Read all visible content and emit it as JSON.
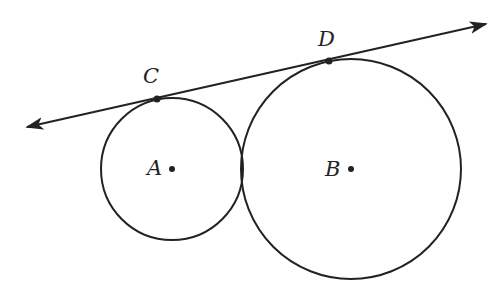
{
  "diagram": {
    "type": "geometry",
    "stroke_color": "#222222",
    "circles": [
      {
        "name": "A",
        "cx": 172,
        "cy": 169,
        "r": 71
      },
      {
        "name": "B",
        "cx": 351,
        "cy": 169,
        "r": 110
      }
    ],
    "line": {
      "x1": 27,
      "y1": 127,
      "x2": 486,
      "y2": 24,
      "arrows": "both"
    },
    "points": [
      {
        "name": "C",
        "x": 157,
        "y": 99
      },
      {
        "name": "D",
        "x": 329,
        "y": 61
      },
      {
        "name": "A",
        "x": 172,
        "y": 169
      },
      {
        "name": "B",
        "x": 351,
        "y": 169
      }
    ],
    "labels": {
      "C": "C",
      "D": "D",
      "A": "A",
      "B": "B"
    }
  }
}
